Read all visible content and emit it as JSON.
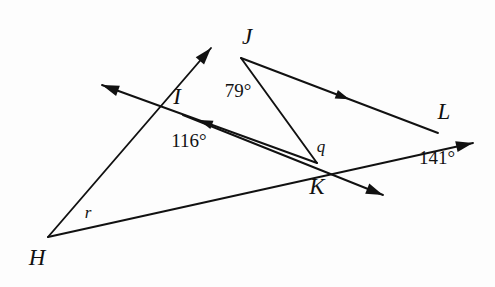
{
  "figure": {
    "type": "geometry-diagram",
    "background_color": "#fdfdfd",
    "stroke_color": "#111111",
    "canvas": {
      "width": 495,
      "height": 287
    }
  },
  "points": [
    {
      "name": "H",
      "label": "H",
      "x": 48,
      "y": 237,
      "label_x": 37,
      "label_y": 257
    },
    {
      "name": "I",
      "label": "I",
      "x": 183,
      "y": 115,
      "label_x": 177,
      "label_y": 96
    },
    {
      "name": "J",
      "label": "J",
      "x": 241,
      "y": 58,
      "label_x": 247,
      "label_y": 36
    },
    {
      "name": "K",
      "label": "K",
      "x": 317,
      "y": 163,
      "label_x": 317,
      "label_y": 186
    },
    {
      "name": "L",
      "label": "L",
      "x": 438,
      "y": 133,
      "label_x": 444,
      "label_y": 111
    }
  ],
  "angle_labels": [
    {
      "name": "angle-79",
      "text": "79°",
      "x": 238,
      "y": 90,
      "at_vertex": "J"
    },
    {
      "name": "angle-116",
      "text": "116°",
      "x": 189,
      "y": 140,
      "at_vertex": "I"
    },
    {
      "name": "angle-141",
      "text": "141°",
      "x": 437,
      "y": 157,
      "at_vertex": "L"
    }
  ],
  "variable_labels": [
    {
      "name": "variable-q",
      "text": "q",
      "x": 321,
      "y": 146,
      "at_vertex": "K"
    },
    {
      "name": "variable-r",
      "text": "r",
      "x": 88,
      "y": 212,
      "at_vertex": "H"
    }
  ],
  "segments": [
    {
      "name": "ray-H-to-J-arrow",
      "x1": 48,
      "y1": 237,
      "x2": 211,
      "y2": 48,
      "arrow_end": true
    },
    {
      "name": "ray-K-to-I-arrow",
      "x1": 317,
      "y1": 163,
      "x2": 102,
      "y2": 85,
      "arrow_end": true,
      "mid_arrow": true
    },
    {
      "name": "ray-I-to-K-arrow",
      "x1": 183,
      "y1": 115,
      "x2": 383,
      "y2": 195,
      "arrow_end": true
    },
    {
      "name": "ray-H-to-L-arrow",
      "x1": 48,
      "y1": 237,
      "x2": 473,
      "y2": 143,
      "arrow_end": true
    },
    {
      "name": "segment-J-to-L",
      "x1": 241,
      "y1": 58,
      "x2": 438,
      "y2": 133,
      "mid_arrow": true
    },
    {
      "name": "segment-J-to-K",
      "x1": 241,
      "y1": 58,
      "x2": 317,
      "y2": 163
    }
  ]
}
